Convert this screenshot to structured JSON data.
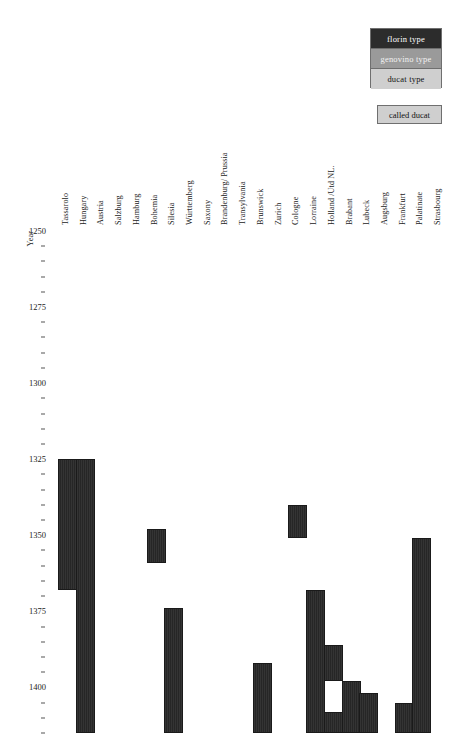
{
  "legend": {
    "types_title": "",
    "items": [
      {
        "label": "florin type",
        "type": "florin",
        "color": "#2c2c2c"
      },
      {
        "label": "genovino type",
        "type": "genovino",
        "color": "#9a9a9a"
      },
      {
        "label": "ducat type",
        "type": "ducat",
        "color": "#cfcfcf"
      }
    ],
    "called_ducat": {
      "label": "called ducat",
      "color": "#cfcfcf"
    }
  },
  "axis": {
    "y_title": "Year",
    "y_min": 1250,
    "y_max": 1415,
    "y_major_ticks": [
      1250,
      1275,
      1300,
      1325,
      1350,
      1375,
      1400
    ],
    "y_minor_step": 5,
    "x_title": ""
  },
  "chart_data": {
    "type": "bar",
    "orientation": "vertical-range",
    "title": "",
    "xlabel": "",
    "ylabel": "Year",
    "ylim": [
      1250,
      1415
    ],
    "y_inverted": true,
    "grid": false,
    "legend_position": "top-right",
    "categories": [
      "Tassarolo",
      "Hungary",
      "Austria",
      "Salzburg",
      "Hamburg",
      "Bohemia",
      "Silesia",
      "Württemberg",
      "Saxony",
      "Brandenburg/ Prussia",
      "Transylvania",
      "Brunswick",
      "Zurich",
      "Cologne",
      "Lorraine",
      "Holland /Utd NL.",
      "Brabant",
      "Lubeck",
      "Augsburg",
      "Frankfurt",
      "Palatinate",
      "Strasbourg"
    ],
    "series": [
      {
        "name": "florin type",
        "color": "#2c2c2c",
        "bars": [
          {
            "category": "Tassarolo",
            "start": 1325,
            "end": 1368
          },
          {
            "category": "Hungary",
            "start": 1325,
            "end": 1415
          },
          {
            "category": "Bohemia",
            "start": 1348,
            "end": 1359
          },
          {
            "category": "Silesia",
            "start": 1374,
            "end": 1415
          },
          {
            "category": "Brunswick",
            "start": 1392,
            "end": 1415
          },
          {
            "category": "Cologne",
            "start": 1340,
            "end": 1351
          },
          {
            "category": "Lorraine",
            "start": 1368,
            "end": 1415
          },
          {
            "category": "Holland /Utd NL.",
            "start": 1386,
            "end": 1398
          },
          {
            "category": "Holland /Utd NL.",
            "start": 1408,
            "end": 1415
          },
          {
            "category": "Brabant",
            "start": 1398,
            "end": 1415
          },
          {
            "category": "Lubeck",
            "start": 1402,
            "end": 1415
          },
          {
            "category": "Frankfurt",
            "start": 1405,
            "end": 1415
          },
          {
            "category": "Palatinate",
            "start": 1351,
            "end": 1415
          }
        ]
      }
    ]
  }
}
